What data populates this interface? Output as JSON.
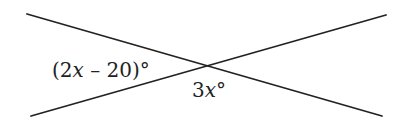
{
  "diagram": {
    "type": "intersecting-lines",
    "stroke_color": "#222222",
    "lines": [
      {
        "name": "line-descending",
        "x1": 27,
        "y1": 14,
        "x2": 382,
        "y2": 116
      },
      {
        "name": "line-ascending",
        "x1": 31,
        "y1": 116,
        "x2": 386,
        "y2": 15
      }
    ],
    "intersection": {
      "x": 207,
      "y": 66
    },
    "labels": {
      "left_angle": {
        "open_paren": "(",
        "coefficient": "2",
        "variable": "x",
        "rest": " – 20)",
        "degree": "°",
        "full": "(2x – 20)°"
      },
      "bottom_angle": {
        "coefficient": "3",
        "variable": "x",
        "degree": "°",
        "full": "3x°"
      }
    }
  }
}
